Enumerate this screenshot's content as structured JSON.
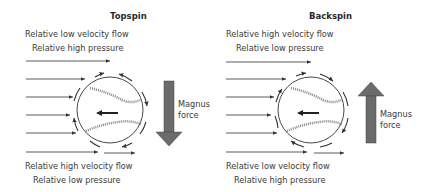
{
  "topspin": {
    "title": "Topspin",
    "top_line1": "Relative low velocity flow",
    "top_line2": "Relative high pressure",
    "bottom_line1": "Relative high velocity flow",
    "bottom_line2": "Relative low pressure",
    "force_line1": "Magnus",
    "force_line2": "force",
    "force_direction": "down"
  },
  "backspin": {
    "title": "Backspin",
    "top_line1": "Relative high velocity flow",
    "top_line2": "Relative low pressure",
    "bottom_line1": "Relative low velocity flow",
    "bottom_line2": "Relative high pressure",
    "force_line1": "Magnus",
    "force_line2": "force",
    "force_direction": "up"
  },
  "colors": {
    "line": "#333333",
    "force_arrow": "#6b6b6b",
    "seam": "#777777"
  }
}
